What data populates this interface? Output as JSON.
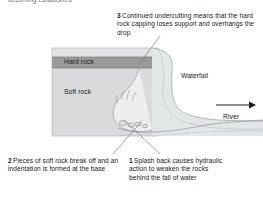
{
  "figure": {
    "type": "waterfall-formation-diagram",
    "clipped_text_above": "becoming established",
    "background_color": "#ffffff"
  },
  "colors": {
    "hard_rock_band": "#9a9a9a",
    "soft_rock_block": "#d8dadb",
    "water": "#e3e6e7",
    "outline": "#808080",
    "text": "#1a1a1a"
  },
  "labels": {
    "hard_rock": "Hard rock",
    "soft_rock": "Soft rock",
    "waterfall": "Waterfall",
    "river": "River"
  },
  "callouts": [
    {
      "number": "1",
      "text": "Splash back causes hydraulic action to weaken the rocks behind the fall of water"
    },
    {
      "number": "2",
      "text": "Pieces of soft rock break off and an indentation is formed at the base"
    },
    {
      "number": "3",
      "text": "Continued undercutting means that the hard rock capping loses support and overhangs the drop"
    }
  ],
  "icons": {
    "flow_arrow": "river-flow-arrow-icon",
    "splash": "splash-droplets-icon",
    "rock_fragments": "broken-rock-fragments-icon"
  }
}
